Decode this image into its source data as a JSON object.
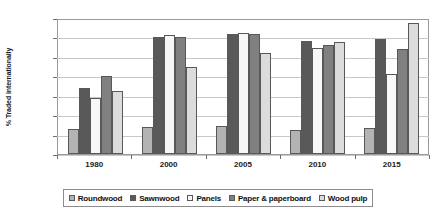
{
  "chart_data": {
    "type": "bar",
    "title": "",
    "xlabel": "",
    "ylabel": "% Traded internationally",
    "ylim": [
      0,
      35
    ],
    "ytick_labels": [
      "35%",
      "30%",
      "25%",
      "20%",
      "15%",
      "10%",
      "5%",
      "0%"
    ],
    "ytick_values": [
      35,
      30,
      25,
      20,
      15,
      10,
      5,
      0
    ],
    "grid": true,
    "legend_position": "bottom",
    "categories": [
      "1980",
      "2000",
      "2005",
      "2010",
      "2015"
    ],
    "series": [
      {
        "name": "Roundwood",
        "color": "#b3b3b3",
        "values": [
          6.5,
          6.9,
          7.3,
          6.3,
          6.8
        ]
      },
      {
        "name": "Sawnwood",
        "color": "#595959",
        "values": [
          17.0,
          30.1,
          31.0,
          29.0,
          29.7
        ]
      },
      {
        "name": "Panels",
        "color": "#f7f7f7",
        "values": [
          14.5,
          30.6,
          31.2,
          27.2,
          20.5
        ]
      },
      {
        "name": "Paper & paperboard",
        "color": "#808080",
        "values": [
          20.0,
          30.1,
          31.0,
          28.0,
          27.0
        ]
      },
      {
        "name": "Wood pulp",
        "color": "#dcdcdc",
        "values": [
          16.3,
          22.5,
          26.0,
          28.7,
          33.7
        ]
      }
    ]
  }
}
